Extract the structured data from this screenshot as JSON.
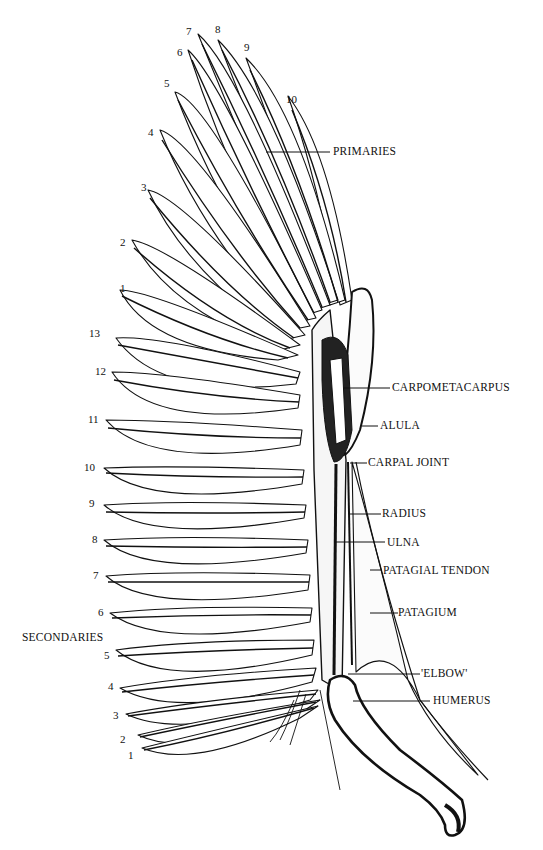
{
  "diagram": {
    "colors": {
      "ink": "#111111",
      "paper": "#ffffff",
      "stipple": "#555555"
    },
    "primaries": {
      "group_label": "PRIMARIES",
      "numbers": [
        "1",
        "2",
        "3",
        "4",
        "5",
        "6",
        "7",
        "8",
        "9",
        "10"
      ]
    },
    "secondaries": {
      "group_label": "SECONDARIES",
      "numbers": [
        "13",
        "12",
        "11",
        "10",
        "9",
        "8",
        "7",
        "6",
        "5",
        "4",
        "3",
        "2",
        "1"
      ]
    },
    "anatomy_labels": {
      "carpometacarpus": "CARPOMETACARPUS",
      "alula": "ALULA",
      "carpal_joint": "CARPAL JOINT",
      "radius": "RADIUS",
      "ulna": "ULNA",
      "patagial_tendon": "PATAGIAL  TENDON",
      "patagium": "PATAGIUM",
      "elbow": "'ELBOW'",
      "humerus": "HUMERUS"
    }
  }
}
